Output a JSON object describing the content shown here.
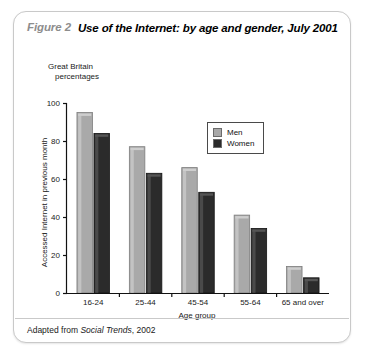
{
  "figure": {
    "number": "Figure 2",
    "title": "Use of the Internet: by age and gender, July 2001",
    "subtitle_line1": "Great Britain",
    "subtitle_line2": "percentages",
    "source_prefix": "Adapted from ",
    "source_italic": "Social Trends",
    "source_suffix": ", 2002"
  },
  "legend": {
    "items": [
      {
        "label": "Men",
        "color": "#a9a9a9"
      },
      {
        "label": "Women",
        "color": "#2b2b2b"
      }
    ]
  },
  "chart_data": {
    "type": "bar",
    "title": "Use of the Internet: by age and gender, July 2001",
    "subtitle": "Great Britain percentages",
    "xlabel": "Age group",
    "ylabel": "Accessed Internet in previous month",
    "categories": [
      "16-24",
      "25-44",
      "45-54",
      "55-64",
      "65 and over"
    ],
    "series": [
      {
        "name": "Men",
        "color": "#a9a9a9",
        "values": [
          95,
          77,
          66,
          41,
          14
        ]
      },
      {
        "name": "Women",
        "color": "#2b2b2b",
        "values": [
          84,
          63,
          53,
          34,
          8
        ]
      }
    ],
    "ylim": [
      0,
      100
    ],
    "yticks": [
      0,
      20,
      40,
      60,
      80,
      100
    ],
    "ytick_labels": [
      "0",
      "20",
      "40",
      "60",
      "80",
      "100"
    ],
    "grid": false,
    "legend_position": "upper-center"
  }
}
